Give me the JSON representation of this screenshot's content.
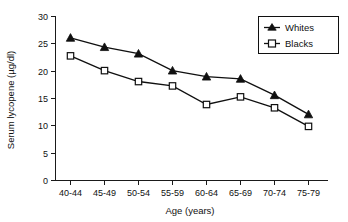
{
  "chart_data": {
    "type": "line",
    "title": "",
    "xlabel": "Age (years)",
    "ylabel": "Serum lycopene (µg/dl)",
    "categories": [
      "40-44",
      "45-49",
      "50-54",
      "55-59",
      "60-64",
      "65-69",
      "70-74",
      "75-79"
    ],
    "series": [
      {
        "name": "Whites",
        "marker": "filled-triangle",
        "values": [
          26.1,
          24.4,
          23.2,
          20.1,
          19.0,
          18.6,
          15.6,
          12.1
        ]
      },
      {
        "name": "Blacks",
        "marker": "open-square",
        "values": [
          22.8,
          20.1,
          18.1,
          17.3,
          13.9,
          15.3,
          13.3,
          9.9
        ]
      }
    ],
    "ylim": [
      0,
      30
    ],
    "yticks": [
      0,
      5,
      10,
      15,
      20,
      25,
      30
    ],
    "ytick_labels": [
      "0",
      "5",
      "10",
      "15",
      "20",
      "25",
      "30"
    ],
    "grid": false,
    "legend_position": "top-right",
    "colors": {
      "axis": "#101010",
      "series_whites": "#101010",
      "series_blacks": "#101010",
      "background": "#ffffff"
    }
  },
  "legend": {
    "entries": [
      {
        "label": "Whites"
      },
      {
        "label": "Blacks"
      }
    ]
  }
}
